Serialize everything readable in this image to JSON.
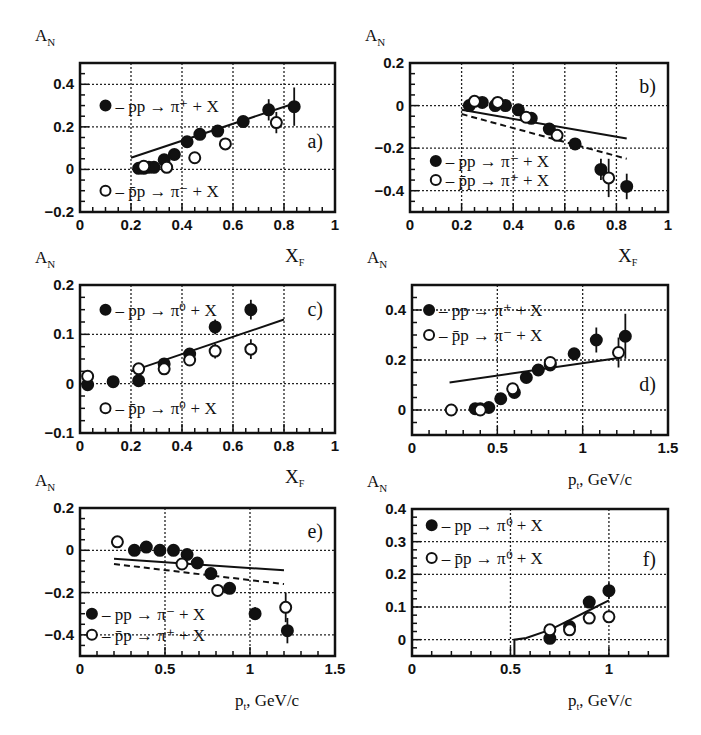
{
  "chart_data": [
    {
      "id": "a",
      "type": "scatter",
      "panel_label": "a)",
      "ylabel": "A_N",
      "xlabel": "X_F",
      "xlim": [
        0,
        1
      ],
      "ylim": [
        -0.2,
        0.5
      ],
      "xticks": [
        0,
        0.2,
        0.4,
        0.6,
        0.8,
        1
      ],
      "xtick_labels": [
        "0",
        "0.2",
        "0.4",
        "0.6",
        "0.8",
        "1"
      ],
      "yticks": [
        -0.2,
        0,
        0.2,
        0.4
      ],
      "ytick_labels": [
        "-0.2",
        "0",
        "0.2",
        "0.4"
      ],
      "grid": true,
      "frame": {
        "x0": 80,
        "x1": 335,
        "y0": 63,
        "y1": 212
      },
      "series": [
        {
          "name": "pp → π⁺ + X",
          "marker": "filled",
          "x": [
            0.23,
            0.25,
            0.27,
            0.29,
            0.33,
            0.37,
            0.42,
            0.47,
            0.54,
            0.64,
            0.74,
            0.84
          ],
          "y": [
            0.005,
            0.005,
            0.01,
            0.01,
            0.045,
            0.07,
            0.13,
            0.165,
            0.18,
            0.225,
            0.28,
            0.295
          ],
          "err": [
            0.01,
            0.01,
            0.01,
            0.01,
            0.01,
            0.01,
            0.015,
            0.015,
            0.02,
            0.02,
            0.05,
            0.09
          ]
        },
        {
          "name": "p̄p → π⁻ + X",
          "marker": "open",
          "x": [
            0.25,
            0.34,
            0.45,
            0.57,
            0.77
          ],
          "y": [
            0.015,
            0.01,
            0.055,
            0.12,
            0.22
          ],
          "err": [
            0.01,
            0.01,
            0.01,
            0.015,
            0.05
          ]
        }
      ],
      "lines": [
        {
          "style": "solid",
          "x": [
            0.2,
            0.84
          ],
          "y": [
            0.055,
            0.31
          ]
        }
      ],
      "legend": [
        {
          "marker": "filled",
          "text": "– pp → π⁺ + X",
          "pos": [
            0.1,
            0.3
          ]
        },
        {
          "marker": "open",
          "text": "– p̄p → π⁻ + X",
          "pos": [
            0.1,
            -0.1
          ]
        }
      ]
    },
    {
      "id": "b",
      "type": "scatter",
      "panel_label": "b)",
      "ylabel": "A_N",
      "xlabel": "X_F",
      "xlim": [
        0,
        1
      ],
      "ylim": [
        -0.5,
        0.2
      ],
      "xticks": [
        0,
        0.2,
        0.4,
        0.6,
        0.8,
        1
      ],
      "xtick_labels": [
        "0",
        "0.2",
        "0.4",
        "0.6",
        "0.8",
        "1"
      ],
      "yticks": [
        -0.4,
        -0.2,
        0,
        0.2
      ],
      "ytick_labels": [
        "-0.4",
        "-0.2",
        "0",
        "0.2"
      ],
      "grid": true,
      "frame": {
        "x0": 410,
        "x1": 668,
        "y0": 63,
        "y1": 212
      },
      "series": [
        {
          "name": "pp → π⁻ + X",
          "marker": "filled",
          "x": [
            0.23,
            0.28,
            0.33,
            0.37,
            0.42,
            0.47,
            0.54,
            0.64,
            0.74,
            0.84
          ],
          "y": [
            0.0,
            0.015,
            0.0,
            0.0,
            -0.02,
            -0.06,
            -0.11,
            -0.18,
            -0.3,
            -0.38
          ],
          "err": [
            0.01,
            0.01,
            0.01,
            0.01,
            0.015,
            0.015,
            0.02,
            0.02,
            0.05,
            0.06
          ]
        },
        {
          "name": "p̄p → π⁺ + X",
          "marker": "open",
          "x": [
            0.25,
            0.34,
            0.45,
            0.57,
            0.77
          ],
          "y": [
            0.02,
            0.015,
            -0.055,
            -0.14,
            -0.34
          ],
          "err": [
            0.01,
            0.01,
            0.015,
            0.02,
            0.09
          ]
        }
      ],
      "lines": [
        {
          "style": "solid",
          "x": [
            0.2,
            0.84
          ],
          "y": [
            -0.02,
            -0.155
          ]
        },
        {
          "style": "dashed",
          "x": [
            0.2,
            0.84
          ],
          "y": [
            -0.04,
            -0.25
          ]
        }
      ],
      "legend": [
        {
          "marker": "filled",
          "text": "– pp → π⁻ + X",
          "pos": [
            0.1,
            -0.26
          ]
        },
        {
          "marker": "open",
          "text": "– p̄p → π⁺ + X",
          "pos": [
            0.1,
            -0.35
          ]
        }
      ]
    },
    {
      "id": "c",
      "type": "scatter",
      "panel_label": "c)",
      "ylabel": "A_N",
      "xlabel": "X_F",
      "xlim": [
        0,
        1
      ],
      "ylim": [
        -0.1,
        0.2
      ],
      "xticks": [
        0,
        0.2,
        0.4,
        0.6,
        0.8,
        1
      ],
      "xtick_labels": [
        "0",
        "0.2",
        "0.4",
        "0.6",
        "0.8",
        "1"
      ],
      "yticks": [
        -0.1,
        0,
        0.1,
        0.2
      ],
      "ytick_labels": [
        "-0.1",
        "0",
        "0.1",
        "0.2"
      ],
      "grid": true,
      "frame": {
        "x0": 80,
        "x1": 335,
        "y0": 285,
        "y1": 433
      },
      "series": [
        {
          "name": "pp → π⁰ + X",
          "marker": "filled",
          "x": [
            0.03,
            0.13,
            0.23,
            0.33,
            0.43,
            0.53,
            0.67
          ],
          "y": [
            -0.002,
            0.004,
            0.006,
            0.04,
            0.06,
            0.115,
            0.15
          ],
          "err": [
            0.005,
            0.005,
            0.005,
            0.008,
            0.01,
            0.015,
            0.02
          ]
        },
        {
          "name": "p̄p → π⁰ + X",
          "marker": "open",
          "x": [
            0.03,
            0.23,
            0.33,
            0.43,
            0.53,
            0.67
          ],
          "y": [
            0.015,
            0.03,
            0.03,
            0.048,
            0.066,
            0.07
          ],
          "err": [
            0.006,
            0.006,
            0.008,
            0.01,
            0.015,
            0.02
          ]
        }
      ],
      "lines": [
        {
          "style": "solid",
          "x": [
            0.2,
            0.8
          ],
          "y": [
            0.025,
            0.13
          ]
        }
      ],
      "legend": [
        {
          "marker": "filled",
          "text": "– pp → π⁰ + X",
          "pos": [
            0.1,
            0.15
          ]
        },
        {
          "marker": "open",
          "text": "– p̄p → π⁰ + X",
          "pos": [
            0.1,
            -0.05
          ]
        }
      ]
    },
    {
      "id": "d",
      "type": "scatter",
      "panel_label": "d)",
      "ylabel": "A_N",
      "xlabel": "p_t, GeV/c",
      "xlim": [
        0,
        1.5
      ],
      "ylim": [
        -0.1,
        0.5
      ],
      "xticks": [
        0,
        0.5,
        1,
        1.5
      ],
      "xtick_labels": [
        "0",
        "0.5",
        "1",
        "1.5"
      ],
      "yticks": [
        0,
        0.2,
        0.4
      ],
      "ytick_labels": [
        "0",
        "0.2",
        "0.4"
      ],
      "grid": true,
      "frame": {
        "x0": 412,
        "x1": 668,
        "y0": 285,
        "y1": 435
      },
      "series": [
        {
          "name": "pp → π⁺ + X",
          "marker": "filled",
          "x": [
            0.37,
            0.4,
            0.45,
            0.52,
            0.6,
            0.67,
            0.74,
            0.81,
            0.95,
            1.08,
            1.25
          ],
          "y": [
            0.005,
            0.005,
            0.01,
            0.045,
            0.07,
            0.13,
            0.16,
            0.18,
            0.225,
            0.28,
            0.295
          ],
          "err": [
            0.01,
            0.01,
            0.01,
            0.01,
            0.015,
            0.015,
            0.02,
            0.02,
            0.02,
            0.05,
            0.09
          ]
        },
        {
          "name": "p̄p → π⁻ + X",
          "marker": "open",
          "x": [
            0.23,
            0.4,
            0.59,
            0.81,
            1.21
          ],
          "y": [
            0.0,
            0.0,
            0.085,
            0.19,
            0.23
          ],
          "err": [
            0.01,
            0.01,
            0.015,
            0.02,
            0.06
          ]
        }
      ],
      "lines": [
        {
          "style": "solid",
          "x": [
            0.22,
            1.23
          ],
          "y": [
            0.11,
            0.21
          ]
        }
      ],
      "legend": [
        {
          "marker": "filled",
          "text": "– pp → π⁺ + X",
          "pos": [
            0.1,
            0.4
          ]
        },
        {
          "marker": "open",
          "text": "– p̄p → π⁻ + X",
          "pos": [
            0.1,
            0.3
          ]
        }
      ]
    },
    {
      "id": "e",
      "type": "scatter",
      "panel_label": "e)",
      "ylabel": "A_N",
      "xlabel": "p_t, GeV/c",
      "xlim": [
        0,
        1.5
      ],
      "ylim": [
        -0.5,
        0.2
      ],
      "xticks": [
        0,
        0.5,
        1,
        1.5
      ],
      "xtick_labels": [
        "0",
        "0.5",
        "1",
        "1.5"
      ],
      "yticks": [
        -0.4,
        -0.2,
        0,
        0.2
      ],
      "ytick_labels": [
        "-0.4",
        "-0.2",
        "0",
        "0.2"
      ],
      "grid": true,
      "frame": {
        "x0": 80,
        "x1": 335,
        "y0": 508,
        "y1": 656
      },
      "series": [
        {
          "name": "pp → π⁻ + X",
          "marker": "filled",
          "x": [
            0.32,
            0.39,
            0.47,
            0.55,
            0.63,
            0.69,
            0.77,
            0.88,
            1.03,
            1.22
          ],
          "y": [
            0.0,
            0.015,
            0.0,
            0.0,
            -0.02,
            -0.06,
            -0.11,
            -0.18,
            -0.3,
            -0.38
          ],
          "err": [
            0.01,
            0.01,
            0.01,
            0.01,
            0.015,
            0.015,
            0.02,
            0.02,
            0.03,
            0.06
          ]
        },
        {
          "name": "p̄p → π⁺ + X",
          "marker": "open",
          "x": [
            0.22,
            0.6,
            0.81,
            1.21
          ],
          "y": [
            0.04,
            -0.065,
            -0.19,
            -0.27
          ],
          "err": [
            0.01,
            0.015,
            0.025,
            0.07
          ]
        }
      ],
      "lines": [
        {
          "style": "solid",
          "x": [
            0.2,
            1.2
          ],
          "y": [
            -0.04,
            -0.095
          ]
        },
        {
          "style": "dashed",
          "x": [
            0.2,
            1.2
          ],
          "y": [
            -0.065,
            -0.16
          ]
        }
      ],
      "legend": [
        {
          "marker": "filled",
          "text": "– pp → π⁻ + X",
          "pos": [
            0.07,
            -0.3
          ]
        },
        {
          "marker": "open",
          "text": "– p̄p → π⁺ + X",
          "pos": [
            0.07,
            -0.4
          ]
        }
      ]
    },
    {
      "id": "f",
      "type": "scatter",
      "panel_label": "f)",
      "ylabel": "A_N",
      "xlabel": "p_t, GeV/c",
      "xlim": [
        0,
        1.3
      ],
      "ylim": [
        -0.05,
        0.4
      ],
      "xticks": [
        0,
        0.5,
        1
      ],
      "xtick_labels": [
        "0",
        "0.5",
        "1"
      ],
      "yticks": [
        0,
        0.1,
        0.2,
        0.3,
        0.4
      ],
      "ytick_labels": [
        "0",
        "0.1",
        "0.2",
        "0.3",
        "0.4"
      ],
      "grid": true,
      "frame": {
        "x0": 412,
        "x1": 668,
        "y0": 509,
        "y1": 656
      },
      "series": [
        {
          "name": "pp → π⁰ + X",
          "marker": "filled",
          "x": [
            0.7,
            0.8,
            0.9,
            1.0
          ],
          "y": [
            0.004,
            0.04,
            0.115,
            0.15
          ],
          "err": [
            0.006,
            0.01,
            0.015,
            0.025
          ]
        },
        {
          "name": "p̄p → π⁰ + X",
          "marker": "open",
          "x": [
            0.7,
            0.8,
            0.9,
            1.0
          ],
          "y": [
            0.03,
            0.03,
            0.066,
            0.07
          ],
          "err": [
            0.006,
            0.008,
            0.012,
            0.015
          ]
        }
      ],
      "lines": [
        {
          "style": "solid",
          "x": [
            0.52,
            0.52,
            0.58,
            0.7,
            0.8,
            0.9,
            1.0
          ],
          "y": [
            -0.05,
            0.0,
            0.005,
            0.03,
            0.06,
            0.09,
            0.12
          ]
        }
      ],
      "legend": [
        {
          "marker": "filled",
          "text": "– pp → π⁰ + X",
          "pos": [
            0.1,
            0.35
          ]
        },
        {
          "marker": "open",
          "text": "– p̄p → π⁰ + X",
          "pos": [
            0.1,
            0.25
          ]
        }
      ]
    }
  ],
  "axis_titles": {
    "an": "A",
    "an_sub": "N",
    "xf": "X",
    "xf_sub": "F",
    "pt": "p",
    "pt_sub": "t",
    "pt_unit": ", GeV/c"
  }
}
